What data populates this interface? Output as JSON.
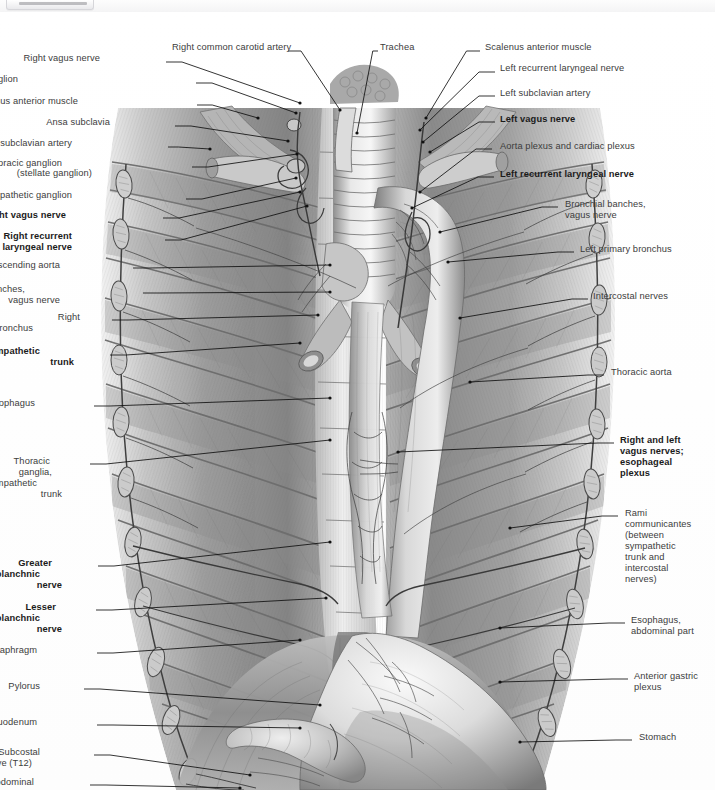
{
  "viewer": {
    "chrome_visible": true
  },
  "plate": {
    "title": "Thoracic viscera and autonomic nerves, posterior mediastinum",
    "style": "grayscale anatomical engraving",
    "ink": "#4a4a4a",
    "background": "#ffffff",
    "leader_color": "#1a1a1a"
  },
  "labels_left": [
    {
      "text": "Right vagus nerve",
      "x": 100,
      "y": 58,
      "bold": false,
      "lx": 166,
      "ly": 62,
      "tx": 300,
      "ty": 103
    },
    {
      "text": "Middle cervical sympathetic ganglion",
      "x": 18,
      "y": 79,
      "bold": false,
      "lx": 196,
      "ly": 83,
      "tx": 296,
      "ty": 113
    },
    {
      "text": "Scalenus anterior muscle",
      "x": 78,
      "y": 101,
      "bold": false,
      "lx": 197,
      "ly": 105,
      "tx": 258,
      "ty": 118
    },
    {
      "text": "Ansa subclavia",
      "x": 110,
      "y": 122,
      "bold": false,
      "lx": 175,
      "ly": 126,
      "tx": 288,
      "ty": 141
    },
    {
      "text": "Right subclavian artery",
      "x": 72,
      "y": 143,
      "bold": false,
      "lx": 168,
      "ly": 147,
      "tx": 210,
      "ty": 149
    },
    {
      "text": "Cervicothoracic ganglion",
      "x": 62,
      "y": 163,
      "bold": false,
      "lx": 192,
      "ly": 167,
      "tx": 297,
      "ty": 154
    },
    {
      "text": "(stellate ganglion)",
      "x": 92,
      "y": 173,
      "bold": false
    },
    {
      "text": "Sympathetic ganglion",
      "x": 72,
      "y": 195,
      "bold": false,
      "lx": 186,
      "ly": 199,
      "tx": 296,
      "ty": 178
    },
    {
      "text": "Right vagus nerve",
      "x": 66,
      "y": 215,
      "bold": true,
      "lx": 163,
      "ly": 218,
      "tx": 300,
      "ty": 192
    },
    {
      "text": "Right recurrent",
      "x": 72,
      "y": 236,
      "bold": true,
      "lx": 165,
      "ly": 240,
      "tx": 307,
      "ty": 206
    },
    {
      "text": "laryngeal nerve",
      "x": 72,
      "y": 247,
      "bold": true
    },
    {
      "text": "Ascending aorta",
      "x": 60,
      "y": 265,
      "bold": false,
      "lx": 133,
      "ly": 268,
      "tx": 330,
      "ty": 265
    },
    {
      "text": "Bronchial branches,",
      "x": 25,
      "y": 289,
      "bold": false,
      "lx": 143,
      "ly": 293,
      "tx": 330,
      "ty": 292
    },
    {
      "text": "vagus nerve",
      "x": 60,
      "y": 300,
      "bold": false
    },
    {
      "text": "Right",
      "x": 80,
      "y": 317,
      "bold": false,
      "lx": 112,
      "ly": 320,
      "tx": 318,
      "ty": 315
    },
    {
      "text": "primary bronchus",
      "x": 33,
      "y": 328,
      "bold": false
    },
    {
      "text": "Sympathetic",
      "x": 40,
      "y": 351,
      "bold": true,
      "lx": 110,
      "ly": 355,
      "tx": 300,
      "ty": 343
    },
    {
      "text": "trunk",
      "x": 74,
      "y": 362,
      "bold": true
    },
    {
      "text": "Esophagus",
      "x": 35,
      "y": 403,
      "bold": false,
      "lx": 94,
      "ly": 406,
      "tx": 330,
      "ty": 398
    },
    {
      "text": "Thoracic",
      "x": 50,
      "y": 461,
      "bold": false,
      "lx": 90,
      "ly": 464,
      "tx": 330,
      "ty": 440
    },
    {
      "text": "ganglia,",
      "x": 52,
      "y": 472,
      "bold": false
    },
    {
      "text": "sympathetic",
      "x": 37,
      "y": 483,
      "bold": false
    },
    {
      "text": "trunk",
      "x": 62,
      "y": 494,
      "bold": false
    },
    {
      "text": "Greater",
      "x": 52,
      "y": 563,
      "bold": true,
      "lx": 98,
      "ly": 566,
      "tx": 330,
      "ty": 542
    },
    {
      "text": "splanchnic",
      "x": 40,
      "y": 574,
      "bold": true
    },
    {
      "text": "nerve",
      "x": 62,
      "y": 585,
      "bold": true
    },
    {
      "text": "Lesser",
      "x": 56,
      "y": 607,
      "bold": true,
      "lx": 96,
      "ly": 610,
      "tx": 326,
      "ty": 598
    },
    {
      "text": "splanchnic",
      "x": 40,
      "y": 618,
      "bold": true
    },
    {
      "text": "nerve",
      "x": 62,
      "y": 629,
      "bold": true
    },
    {
      "text": "Diaphragm",
      "x": 37,
      "y": 650,
      "bold": false,
      "lx": 97,
      "ly": 653,
      "tx": 300,
      "ty": 640
    },
    {
      "text": "Pylorus",
      "x": 40,
      "y": 686,
      "bold": false,
      "lx": 84,
      "ly": 689,
      "tx": 320,
      "ty": 705
    },
    {
      "text": "Duodenum",
      "x": 37,
      "y": 722,
      "bold": false,
      "lx": 97,
      "ly": 725,
      "tx": 300,
      "ty": 728
    },
    {
      "text": "Subcostal",
      "x": 40,
      "y": 752,
      "bold": false,
      "lx": 94,
      "ly": 755,
      "tx": 250,
      "ty": 775
    },
    {
      "text": "nerve (T12)",
      "x": 32,
      "y": 763,
      "bold": false
    },
    {
      "text": "Abdominal",
      "x": 34,
      "y": 782,
      "bold": false,
      "lx": 90,
      "ly": 785,
      "tx": 240,
      "ty": 788
    }
  ],
  "labels_right": [
    {
      "text": "Scalenus anterior muscle",
      "x": 485,
      "y": 47,
      "bold": false,
      "lx": 480,
      "ly": 51,
      "tx": 426,
      "ty": 118
    },
    {
      "text": "Left recurrent laryngeal nerve",
      "x": 500,
      "y": 68,
      "bold": false,
      "lx": 495,
      "ly": 72,
      "tx": 420,
      "ty": 130
    },
    {
      "text": "Left subclavian artery",
      "x": 500,
      "y": 93,
      "bold": false,
      "lx": 495,
      "ly": 96,
      "tx": 423,
      "ty": 142
    },
    {
      "text": "Left vagus nerve",
      "x": 500,
      "y": 119,
      "bold": true,
      "lx": 495,
      "ly": 122,
      "tx": 430,
      "ty": 152
    },
    {
      "text": "Aorta plexus and cardiac plexus",
      "x": 500,
      "y": 146,
      "bold": false,
      "lx": 492,
      "ly": 149,
      "tx": 420,
      "ty": 192
    },
    {
      "text": "Left recurrent laryngeal nerve",
      "x": 500,
      "y": 174,
      "bold": true,
      "lx": 494,
      "ly": 177,
      "tx": 412,
      "ty": 208
    },
    {
      "text": "Bronchial banches,",
      "x": 565,
      "y": 204,
      "bold": false,
      "lx": 558,
      "ly": 207,
      "tx": 440,
      "ty": 232
    },
    {
      "text": "vagus nerve",
      "x": 565,
      "y": 215,
      "bold": false
    },
    {
      "text": "Left primary bronchus",
      "x": 580,
      "y": 249,
      "bold": false,
      "lx": 574,
      "ly": 252,
      "tx": 448,
      "ty": 262
    },
    {
      "text": "Intercostal nerves",
      "x": 593,
      "y": 296,
      "bold": false,
      "lx": 588,
      "ly": 299,
      "tx": 460,
      "ty": 318
    },
    {
      "text": "Thoracic aorta",
      "x": 611,
      "y": 372,
      "bold": false,
      "lx": 604,
      "ly": 375,
      "tx": 470,
      "ty": 382
    },
    {
      "text": "Right and left",
      "x": 620,
      "y": 440,
      "bold": true,
      "lx": 614,
      "ly": 443,
      "tx": 398,
      "ty": 452
    },
    {
      "text": "vagus nerves;",
      "x": 620,
      "y": 451,
      "bold": true
    },
    {
      "text": "esophageal",
      "x": 620,
      "y": 462,
      "bold": true
    },
    {
      "text": "plexus",
      "x": 620,
      "y": 473,
      "bold": true
    },
    {
      "text": "Rami",
      "x": 625,
      "y": 513,
      "bold": false,
      "lx": 618,
      "ly": 516,
      "tx": 510,
      "ty": 528
    },
    {
      "text": "communicantes",
      "x": 625,
      "y": 524,
      "bold": false
    },
    {
      "text": "(between",
      "x": 625,
      "y": 535,
      "bold": false
    },
    {
      "text": "sympathetic",
      "x": 625,
      "y": 546,
      "bold": false
    },
    {
      "text": "trunk and",
      "x": 625,
      "y": 557,
      "bold": false
    },
    {
      "text": "intercostal",
      "x": 625,
      "y": 568,
      "bold": false
    },
    {
      "text": "nerves)",
      "x": 625,
      "y": 579,
      "bold": false
    },
    {
      "text": "Esophagus,",
      "x": 631,
      "y": 620,
      "bold": false,
      "lx": 625,
      "ly": 623,
      "tx": 500,
      "ty": 628
    },
    {
      "text": "abdominal part",
      "x": 631,
      "y": 631,
      "bold": false
    },
    {
      "text": "Anterior gastric",
      "x": 634,
      "y": 676,
      "bold": false,
      "lx": 628,
      "ly": 679,
      "tx": 500,
      "ty": 682
    },
    {
      "text": "plexus",
      "x": 634,
      "y": 687,
      "bold": false
    },
    {
      "text": "Stomach",
      "x": 639,
      "y": 737,
      "bold": false,
      "lx": 632,
      "ly": 740,
      "tx": 520,
      "ty": 742
    }
  ],
  "labels_center": [
    {
      "text": "Right common carotid artery",
      "x": 172,
      "y": 47,
      "bold": false,
      "lx": 288,
      "ly": 51,
      "tx": 340,
      "ty": 110
    },
    {
      "text": "Trachea",
      "x": 380,
      "y": 47,
      "bold": false,
      "lx": 378,
      "ly": 51,
      "tx": 357,
      "ty": 133
    }
  ]
}
